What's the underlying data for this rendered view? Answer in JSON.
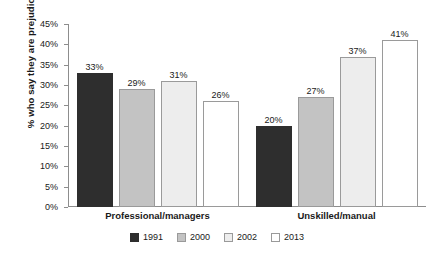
{
  "chart_data": {
    "type": "bar",
    "title": "",
    "subtitle": "",
    "xlabel": "",
    "ylabel": "% who say they are prejudiced",
    "categories": [
      "Professional/managers",
      "Unskilled/manual"
    ],
    "series": [
      {
        "name": "1991",
        "color": "#2e2e2e",
        "border": "#2e2e2e",
        "values": [
          33,
          20
        ],
        "labels": [
          "33%",
          "20%"
        ]
      },
      {
        "name": "2000",
        "color": "#c3c3c3",
        "border": "#9a9a9a",
        "values": [
          29,
          27
        ],
        "labels": [
          "29%",
          "27%"
        ]
      },
      {
        "name": "2002",
        "color": "#ededed",
        "border": "#9a9a9a",
        "values": [
          31,
          37
        ],
        "labels": [
          "31%",
          "37%"
        ]
      },
      {
        "name": "2013",
        "color": "#ffffff",
        "border": "#9a9a9a",
        "values": [
          26,
          41
        ],
        "labels": [
          "26%",
          "41%"
        ]
      }
    ],
    "ylim": [
      0,
      45
    ],
    "ytick_labels": [
      "45%",
      "40%",
      "35%",
      "30%",
      "25%",
      "20%",
      "15%",
      "10%",
      "5%",
      "0%"
    ],
    "ytick_values": [
      45,
      40,
      35,
      30,
      25,
      20,
      15,
      10,
      5,
      0
    ],
    "grid": false,
    "legend_position": "bottom-center",
    "axis_color": "#8d8d8d",
    "text_color": "#1a1a1a",
    "background": "#ffffff"
  }
}
